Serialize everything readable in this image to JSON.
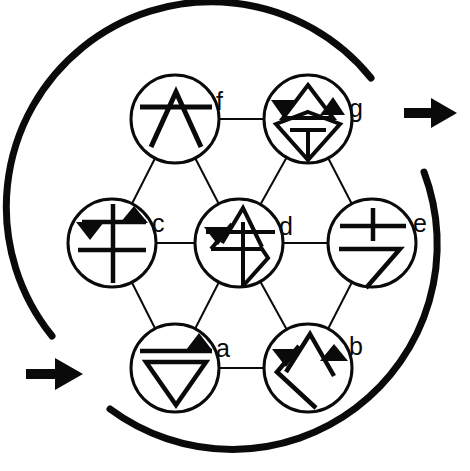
{
  "figure": {
    "background_color": "#ffffff",
    "ink_color": "#0a0a0a",
    "canvas": {
      "width": 470,
      "height": 471
    },
    "outer_boundary": {
      "shape": "broken-circle-arcs",
      "center": [
        232,
        236
      ],
      "radius": 205,
      "stroke_width": 7,
      "arcs": [
        {
          "name": "upper-left-arc",
          "start_deg": 151,
          "end_deg": 341
        },
        {
          "name": "right-lower-arc",
          "start_deg": 349,
          "end_deg": 128
        }
      ]
    },
    "arrows": [
      {
        "name": "left-arrow",
        "direction": "right",
        "x": 26,
        "y": 374,
        "length": 54,
        "head": 18
      },
      {
        "name": "right-arrow",
        "direction": "right",
        "x": 404,
        "y": 113,
        "length": 52,
        "head": 18
      }
    ],
    "node_radius": 44,
    "node_stroke_width": 3,
    "edge_stroke_width": 2,
    "nodes": [
      {
        "id": "f",
        "label": "f",
        "cx": 175,
        "cy": 119,
        "label_x": 222,
        "label_y": 110,
        "glyph": "caret-with-bar"
      },
      {
        "id": "g",
        "label": "g",
        "cx": 308,
        "cy": 119,
        "label_x": 355,
        "label_y": 117,
        "glyph": "diamond-caret-twin-triangles-tee"
      },
      {
        "id": "c",
        "label": "c",
        "cx": 112,
        "cy": 243,
        "label_x": 158,
        "label_y": 232,
        "glyph": "double-cross-twin-triangles"
      },
      {
        "id": "d",
        "label": "d",
        "cx": 239,
        "cy": 243,
        "label_x": 285,
        "label_y": 235,
        "glyph": "arrow-diamond-left-triangle"
      },
      {
        "id": "e",
        "label": "e",
        "cx": 372,
        "cy": 243,
        "label_x": 419,
        "label_y": 232,
        "glyph": "cross-with-seven"
      },
      {
        "id": "a",
        "label": "a",
        "cx": 175,
        "cy": 368,
        "label_x": 222,
        "label_y": 357,
        "glyph": "bar-triangle-down-triangle"
      },
      {
        "id": "b",
        "label": "b",
        "cx": 308,
        "cy": 368,
        "label_x": 355,
        "label_y": 355,
        "glyph": "caret-twin-triangles-angle"
      }
    ],
    "edges": [
      {
        "from": "f",
        "to": "g",
        "name": "edge-f-g"
      },
      {
        "from": "f",
        "to": "c",
        "name": "edge-f-c"
      },
      {
        "from": "f",
        "to": "d",
        "name": "edge-f-d"
      },
      {
        "from": "g",
        "to": "d",
        "name": "edge-g-d"
      },
      {
        "from": "g",
        "to": "e",
        "name": "edge-g-e"
      },
      {
        "from": "c",
        "to": "d",
        "name": "edge-c-d"
      },
      {
        "from": "c",
        "to": "a",
        "name": "edge-c-a"
      },
      {
        "from": "d",
        "to": "e",
        "name": "edge-d-e"
      },
      {
        "from": "d",
        "to": "a",
        "name": "edge-d-a"
      },
      {
        "from": "d",
        "to": "b",
        "name": "edge-d-b"
      },
      {
        "from": "e",
        "to": "b",
        "name": "edge-e-b"
      },
      {
        "from": "a",
        "to": "b",
        "name": "edge-a-b"
      }
    ]
  }
}
